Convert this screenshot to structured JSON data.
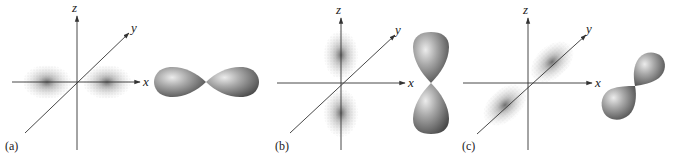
{
  "figure": {
    "colors": {
      "axis": "#333333",
      "cloud": "#555555",
      "lobe_light": "#e6e6e6",
      "lobe_mid": "#9a9a9a",
      "lobe_dark": "#4a4a4a"
    },
    "panels": [
      {
        "label": "(a)",
        "orbital_axis": "x",
        "axes": {
          "x": "x",
          "y": "y",
          "z": "z"
        }
      },
      {
        "label": "(b)",
        "orbital_axis": "z",
        "axes": {
          "x": "x",
          "y": "y",
          "z": "z"
        }
      },
      {
        "label": "(c)",
        "orbital_axis": "y",
        "axes": {
          "x": "x",
          "y": "y",
          "z": "z"
        }
      }
    ]
  }
}
